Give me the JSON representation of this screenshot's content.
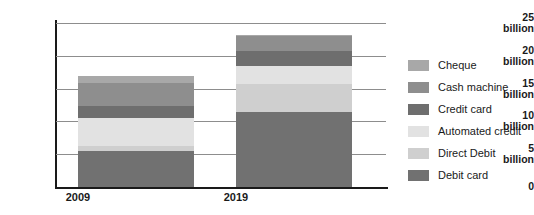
{
  "chart_data": {
    "type": "bar",
    "subtype": "stacked-bar",
    "title": "",
    "xlabel": "",
    "ylabel": "",
    "categories": [
      "2009",
      "2019"
    ],
    "ylim": [
      0,
      25
    ],
    "yticks": [
      {
        "value": 25,
        "num": "25",
        "unit": "billion"
      },
      {
        "value": 20,
        "num": "20",
        "unit": "billion"
      },
      {
        "value": 15,
        "num": "15",
        "unit": "billion"
      },
      {
        "value": 10,
        "num": "10",
        "unit": "billion"
      },
      {
        "value": 5,
        "num": "5",
        "unit": "billion"
      },
      {
        "value": 0,
        "num": "0",
        "unit": ""
      }
    ],
    "grid": true,
    "legend_position": "right",
    "stack_order_bottom_to_top": [
      "Debit card",
      "Direct Debit",
      "Automated credit",
      "Credit card",
      "Cash machine",
      "Cheque"
    ],
    "series": [
      {
        "name": "Cheque",
        "color": "#a8a8a8",
        "values": [
          1.2,
          0.2
        ]
      },
      {
        "name": "Cash machine",
        "color": "#8e8e8e",
        "values": [
          3.5,
          2.2
        ]
      },
      {
        "name": "Credit card",
        "color": "#6e6e6e",
        "values": [
          1.8,
          2.3
        ]
      },
      {
        "name": "Automated credit",
        "color": "#e2e2e2",
        "values": [
          4.2,
          2.8
        ]
      },
      {
        "name": "Direct Debit",
        "color": "#cfcfcf",
        "values": [
          0.8,
          4.2
        ]
      },
      {
        "name": "Debit card",
        "color": "#717171",
        "values": [
          5.5,
          11.5
        ]
      }
    ],
    "totals": [
      17.0,
      23.2
    ]
  },
  "legend": {
    "items": [
      {
        "label": "Cheque",
        "color": "#a8a8a8"
      },
      {
        "label": "Cash machine",
        "color": "#8e8e8e"
      },
      {
        "label": "Credit card",
        "color": "#6e6e6e"
      },
      {
        "label": "Automated credit",
        "color": "#e2e2e2"
      },
      {
        "label": "Direct Debit",
        "color": "#cfcfcf"
      },
      {
        "label": "Debit card",
        "color": "#717171"
      }
    ]
  },
  "axes": {
    "axis_color": "#1a1a1a",
    "grid_color": "#8d8d8d"
  }
}
